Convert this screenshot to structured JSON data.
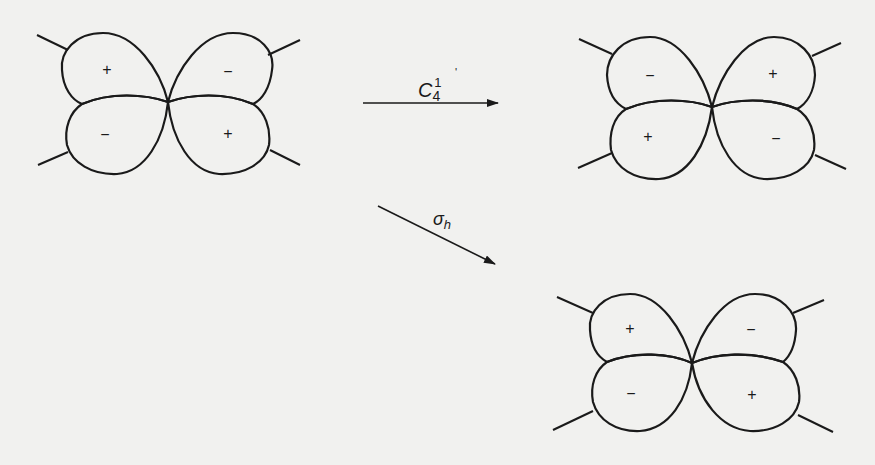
{
  "diagram": {
    "original": {
      "lobes": {
        "top_left": "+",
        "top_right": "−",
        "bottom_left": "−",
        "bottom_right": "+"
      }
    },
    "after_c4": {
      "lobes": {
        "top_left": "−",
        "top_right": "+",
        "bottom_left": "+",
        "bottom_right": "−"
      }
    },
    "after_sigma_h": {
      "lobes": {
        "top_left": "+",
        "top_right": "−",
        "bottom_left": "−",
        "bottom_right": "+"
      }
    },
    "arrows": {
      "c4": {
        "symbol": "C",
        "subscript": "4",
        "superscript": "1",
        "tick": "'"
      },
      "sigma_h": {
        "symbol": "σ",
        "subscript": "h"
      }
    },
    "colors": {
      "ink": "#1a1a1a",
      "paper": "#f1f1ef"
    }
  }
}
